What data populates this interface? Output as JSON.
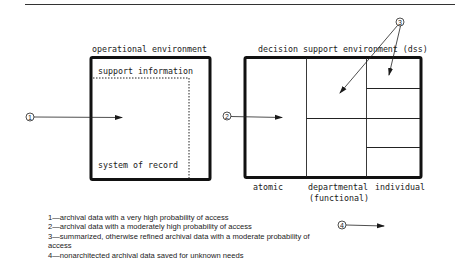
{
  "operational": {
    "title": "operational environment",
    "support_label": "support information",
    "record_label": "system of record"
  },
  "dss": {
    "title": "decision support environment (dss)",
    "columns": [
      "atomic",
      "departmental",
      "individual"
    ],
    "departmental_sub": "(functional)"
  },
  "markers": [
    "1",
    "2",
    "3",
    "4"
  ],
  "legend": [
    "1—archival data with a very high probability of access",
    "2—archival data with a moderately high probability of access",
    "3—summarized, otherwise refined archival data with a moderate probability of access",
    "4—nonarchitected archival data saved for unknown needs"
  ]
}
